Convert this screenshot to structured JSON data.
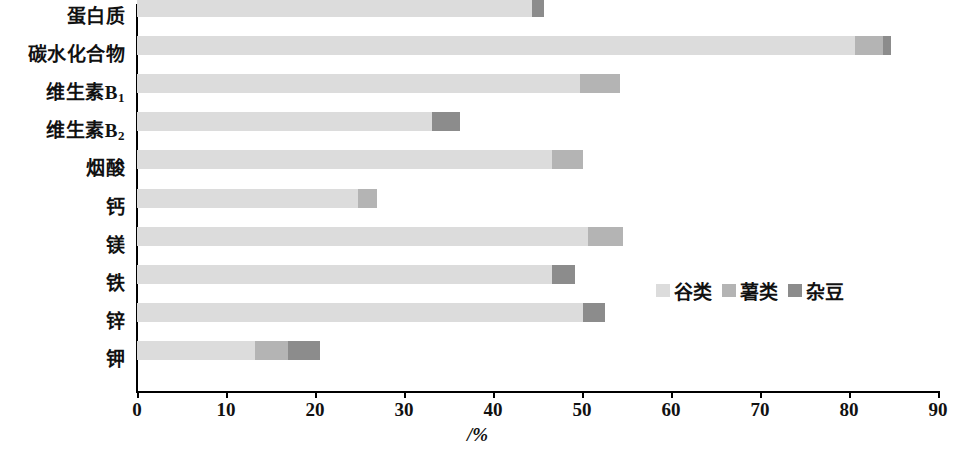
{
  "chart_data": {
    "type": "bar",
    "orientation": "horizontal",
    "stacked": true,
    "title": "",
    "xlabel": "/%",
    "ylabel": "",
    "xlim": [
      0,
      90
    ],
    "xticks": [
      0,
      10,
      20,
      30,
      40,
      50,
      60,
      70,
      80,
      90
    ],
    "xtick_labels": [
      "0",
      "10",
      "20",
      "30",
      "40",
      "50",
      "60",
      "70",
      "80",
      "90"
    ],
    "grid": false,
    "legend_position": "inside-right-middle",
    "categories": [
      "蛋白质",
      "碳水化合物",
      "维生素B₁",
      "维生素B₂",
      "烟酸",
      "钙",
      "镁",
      "铁",
      "锌",
      "钾"
    ],
    "series": [
      {
        "name": "谷类",
        "color": "#dcdcdc",
        "values": [
          44.4,
          80.7,
          49.8,
          33.1,
          46.6,
          24.8,
          50.7,
          46.6,
          50.1,
          13.3
        ]
      },
      {
        "name": "薯类",
        "color": "#b4b4b4",
        "values": [
          0.0,
          3.1,
          4.5,
          0.0,
          3.5,
          2.2,
          3.9,
          0.0,
          0.0,
          3.7
        ]
      },
      {
        "name": "杂豆",
        "color": "#8c8c8c",
        "values": [
          1.3,
          0.9,
          0.0,
          3.2,
          0.0,
          0.0,
          0.0,
          2.6,
          2.5,
          3.6
        ]
      }
    ],
    "totals": [
      45.7,
      84.7,
      54.3,
      36.3,
      50.1,
      27.0,
      54.6,
      49.2,
      52.6,
      20.6
    ]
  },
  "colors": {
    "axis": "#000000",
    "background": "#ffffff",
    "series_cereal": "#dcdcdc",
    "series_tuber": "#b4b4b4",
    "series_bean": "#8c8c8c"
  },
  "legend": {
    "items": [
      {
        "label": "谷类",
        "color": "#dcdcdc"
      },
      {
        "label": "薯类",
        "color": "#b4b4b4"
      },
      {
        "label": "杂豆",
        "color": "#8c8c8c"
      }
    ]
  },
  "axis": {
    "x_title": "/%"
  }
}
